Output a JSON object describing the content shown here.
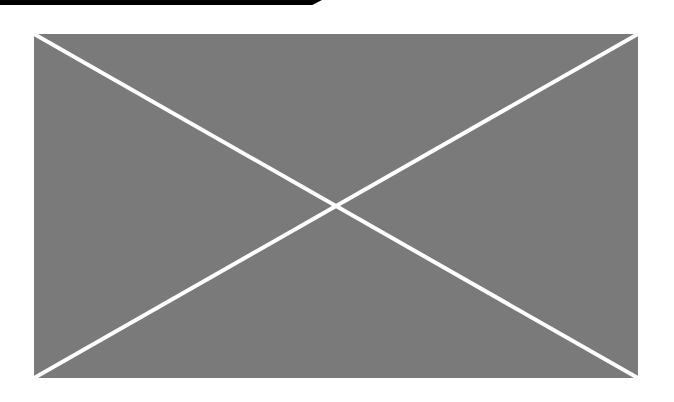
{
  "page": {
    "background": "#ffffff"
  },
  "top_bar": {
    "color": "#000000"
  },
  "image_placeholder": {
    "icon": "broken-image-x-icon",
    "fill_color": "#7a7a7a",
    "line_color": "#ffffff",
    "alt_text": ""
  }
}
